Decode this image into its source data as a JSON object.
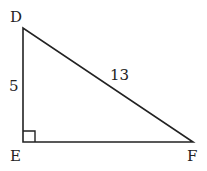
{
  "diagram": {
    "type": "right-triangle",
    "vertices": {
      "D": {
        "label": "D",
        "x": 23,
        "y": 28
      },
      "E": {
        "label": "E",
        "x": 23,
        "y": 142
      },
      "F": {
        "label": "F",
        "x": 193,
        "y": 142
      }
    },
    "right_angle_at": "E",
    "sides": {
      "DE": {
        "label": "5"
      },
      "DF": {
        "label": "13"
      },
      "EF": {
        "label": ""
      }
    },
    "stroke_color": "#222222",
    "background": "#ffffff"
  }
}
